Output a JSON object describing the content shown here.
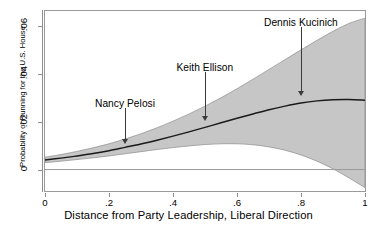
{
  "chart_data": {
    "type": "line",
    "title": "",
    "xlabel": "Distance from Party Leadership, Liberal Direction",
    "ylabel": "Probability of Running for the U.S. House",
    "xlim": [
      0,
      1
    ],
    "ylim": [
      -0.009,
      0.0665
    ],
    "xticks": [
      0,
      0.2,
      0.4,
      0.6,
      0.8,
      1
    ],
    "xticklabels": [
      "0",
      ".2",
      ".4",
      ".6",
      ".8",
      "1"
    ],
    "yticks": [
      0,
      0.02,
      0.04,
      0.06
    ],
    "yticklabels": [
      "0",
      ".02",
      ".04",
      ".06"
    ],
    "grid": false,
    "legend": null,
    "zero_reference_line": 0,
    "band_color": "#c6c6c6",
    "line_color": "#1a1a1a",
    "series": [
      {
        "name": "Predicted probability",
        "x": [
          0.0,
          0.05,
          0.1,
          0.15,
          0.2,
          0.25,
          0.3,
          0.35,
          0.4,
          0.45,
          0.5,
          0.55,
          0.6,
          0.65,
          0.7,
          0.75,
          0.8,
          0.85,
          0.9,
          0.95,
          1.0
        ],
        "values": [
          0.004,
          0.0048,
          0.0057,
          0.0067,
          0.0079,
          0.0093,
          0.0107,
          0.0123,
          0.014,
          0.0158,
          0.0177,
          0.0196,
          0.0215,
          0.0233,
          0.0251,
          0.0266,
          0.0279,
          0.0288,
          0.0293,
          0.0294,
          0.0291
        ]
      },
      {
        "name": "95% CI upper",
        "x": [
          0.0,
          0.05,
          0.1,
          0.15,
          0.2,
          0.25,
          0.3,
          0.35,
          0.4,
          0.45,
          0.5,
          0.55,
          0.6,
          0.65,
          0.7,
          0.75,
          0.8,
          0.85,
          0.9,
          0.95,
          1.0
        ],
        "values": [
          0.0052,
          0.0063,
          0.0076,
          0.0091,
          0.0108,
          0.0128,
          0.015,
          0.0175,
          0.0203,
          0.0233,
          0.0266,
          0.0301,
          0.0339,
          0.0379,
          0.042,
          0.0461,
          0.0502,
          0.0542,
          0.058,
          0.0613,
          0.0635
        ]
      },
      {
        "name": "95% CI lower",
        "x": [
          0.0,
          0.05,
          0.1,
          0.15,
          0.2,
          0.25,
          0.3,
          0.35,
          0.4,
          0.45,
          0.5,
          0.55,
          0.6,
          0.65,
          0.7,
          0.75,
          0.8,
          0.85,
          0.9,
          0.95,
          1.0
        ],
        "values": [
          0.0029,
          0.0035,
          0.0042,
          0.0049,
          0.0057,
          0.0066,
          0.0075,
          0.0084,
          0.0092,
          0.0099,
          0.0105,
          0.0108,
          0.0108,
          0.0104,
          0.0095,
          0.0081,
          0.0061,
          0.0035,
          0.0003,
          -0.0035,
          -0.0076
        ]
      }
    ],
    "annotations": [
      {
        "label": "Nancy Pelosi",
        "x": 0.25,
        "label_y": 0.0255,
        "arrow_tip_y": 0.0108
      },
      {
        "label": "Keith Ellison",
        "x": 0.5,
        "label_y": 0.0405,
        "arrow_tip_y": 0.0205
      },
      {
        "label": "Dennis Kucinich",
        "x": 0.8,
        "label_y": 0.0595,
        "arrow_tip_y": 0.031
      }
    ]
  }
}
